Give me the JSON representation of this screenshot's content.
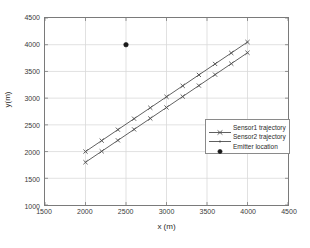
{
  "chart_data": {
    "type": "line",
    "title": "",
    "xlabel": "x (m)",
    "ylabel": "y(m)",
    "xlim": [
      1500,
      4500
    ],
    "ylim": [
      1000,
      4500
    ],
    "xticks": [
      1500,
      2000,
      2500,
      3000,
      3500,
      4000,
      4500
    ],
    "yticks": [
      1000,
      1500,
      2000,
      2500,
      3000,
      3500,
      4000,
      4500
    ],
    "grid": true,
    "legend_position": "center-right",
    "series": [
      {
        "name": "Sensor1 trajectory",
        "marker": "x",
        "color": "#4d4d4d",
        "x": [
          2000,
          2200,
          2400,
          2600,
          2800,
          3000,
          3200,
          3400,
          3600,
          3800,
          4000
        ],
        "y": [
          2000,
          2205,
          2410,
          2615,
          2820,
          3025,
          3230,
          3435,
          3640,
          3845,
          4050
        ]
      },
      {
        "name": "Sensor2 trajectory",
        "marker": "x",
        "color": "#4d4d4d",
        "x": [
          2000,
          2200,
          2400,
          2600,
          2800,
          3000,
          3200,
          3400,
          3600,
          3800,
          4000
        ],
        "y": [
          1800,
          2005,
          2210,
          2415,
          2620,
          2825,
          3030,
          3235,
          3440,
          3645,
          3850
        ]
      },
      {
        "name": "Emitter location",
        "marker": "filled-circle",
        "color": "#1a1a1a",
        "x": [
          2500
        ],
        "y": [
          4000
        ]
      }
    ]
  },
  "legend": {
    "items": [
      {
        "label": "Sensor1 trajectory",
        "marker": "x-marker"
      },
      {
        "label": "Sensor2 trajectory",
        "marker": "dot-marker"
      },
      {
        "label": "Emitter location",
        "marker": "filled-circle-marker"
      }
    ]
  },
  "colors": {
    "axis": "#7a7a7a",
    "grid": "#d9d9d9",
    "series": "#4d4d4d",
    "emitter": "#1a1a1a",
    "text": "#2b2b2b",
    "background": "#ffffff"
  }
}
